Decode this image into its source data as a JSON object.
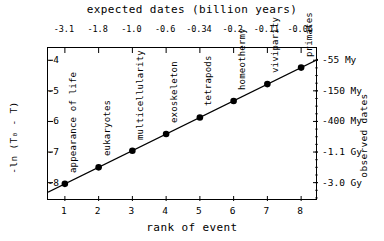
{
  "chart_data": {
    "type": "scatter",
    "title": "expected dates (billion years)",
    "xlabel": "rank of event",
    "ylabel": "-ln (T₀ - T)",
    "right_axis_label": "observed dates",
    "xlim": [
      0.5,
      8.5
    ],
    "ylim": [
      -8.6,
      -3.6
    ],
    "grid": false,
    "legend": "none",
    "x": [
      1,
      2,
      3,
      4,
      5,
      6,
      7,
      8
    ],
    "y": [
      -8.04,
      -7.5,
      -6.96,
      -6.41,
      -5.87,
      -5.33,
      -4.78,
      -4.24
    ],
    "xticks": [
      "1",
      "2",
      "3",
      "4",
      "5",
      "6",
      "7",
      "8"
    ],
    "yticks": [
      "-4",
      "-5",
      "-6",
      "-7",
      "-8"
    ],
    "ytick_values": [
      -4,
      -5,
      -6,
      -7,
      -8
    ],
    "top_axis_title": "expected dates (billion years)",
    "top_ticklabels": [
      "-3.1",
      "-1.8",
      "-1.0",
      "-0.6",
      "-0.34",
      "-0.2",
      "-0.11",
      "-0.06"
    ],
    "right_ticklabels": [
      "-55 My",
      "-150 My",
      "-400 My",
      "-1.1 Gy",
      "-3.0 Gy"
    ],
    "right_tick_values": [
      -4,
      -5,
      -6,
      -7,
      -8
    ],
    "annotations": [
      "appearance of life",
      "eukaryotes",
      "multicellularity",
      "exoskeleton",
      "tetrapods",
      "homeothermy",
      "viviparity",
      "primates"
    ],
    "fit_line": {
      "from": [
        0.5,
        -8.31
      ],
      "to": [
        8.5,
        -3.97
      ]
    },
    "marker": "filled-circle",
    "marker_color": "#000000",
    "line_color": "#000000",
    "axis_color": "#000000",
    "background": "#ffffff"
  }
}
